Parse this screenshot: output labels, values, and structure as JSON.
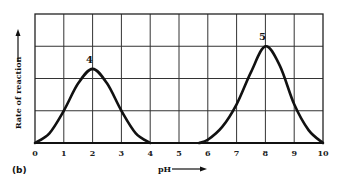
{
  "chart_data": {
    "type": "line",
    "title": "",
    "panel_label": "(b)",
    "xlabel": "pH",
    "ylabel": "Rate of reaction",
    "xlim": [
      0,
      10
    ],
    "ylim": [
      0,
      4
    ],
    "x_ticks": [
      "0",
      "1",
      "2",
      "3",
      "4",
      "5",
      "6",
      "7",
      "8",
      "9",
      "10"
    ],
    "y_ticks": [],
    "grid": true,
    "legend": null,
    "series": [
      {
        "name": "4",
        "peak_label": "4",
        "x": [
          0,
          0.5,
          1,
          1.5,
          2,
          2.5,
          3,
          3.5,
          4
        ],
        "values": [
          0,
          0.3,
          1.0,
          1.85,
          2.3,
          1.85,
          1.0,
          0.3,
          0
        ]
      },
      {
        "name": "5",
        "peak_label": "5",
        "x": [
          5.7,
          6,
          6.5,
          7,
          7.5,
          8,
          8.5,
          9,
          9.5,
          10
        ],
        "values": [
          0,
          0.1,
          0.5,
          1.2,
          2.2,
          3.0,
          2.4,
          1.2,
          0.4,
          0
        ]
      }
    ]
  }
}
